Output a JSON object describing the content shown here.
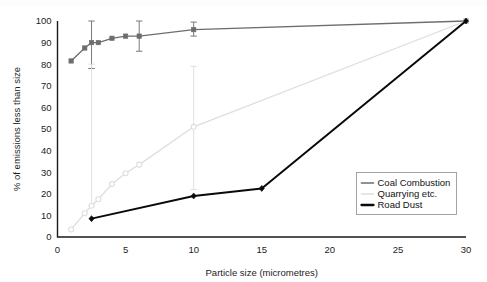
{
  "chart_data": {
    "type": "line",
    "title": "",
    "xlabel": "Particle size (micrometres)",
    "ylabel": "% of emissions less than size",
    "xlim": [
      0,
      30
    ],
    "ylim": [
      0,
      100
    ],
    "xticks": [
      0,
      5,
      10,
      15,
      20,
      25,
      30
    ],
    "yticks": [
      0,
      10,
      20,
      30,
      40,
      50,
      60,
      70,
      80,
      90,
      100
    ],
    "grid": false,
    "legend_position": "lower-right",
    "series": [
      {
        "name": "Coal Combustion",
        "color": "#6d6d6d",
        "marker": "square",
        "linewidth": 1.3,
        "x": [
          1,
          2,
          2.5,
          3,
          4,
          5,
          6,
          10,
          30
        ],
        "values": [
          81.5,
          87.5,
          90.0,
          90.0,
          92.0,
          93.0,
          93.0,
          96.0,
          100.0
        ],
        "error_bars": [
          {
            "x": 2.5,
            "low": 78.0,
            "high": 100.0
          },
          {
            "x": 6,
            "low": 86.0,
            "high": 100.0
          },
          {
            "x": 10,
            "low": 93.0,
            "high": 99.5
          }
        ]
      },
      {
        "name": "Quarrying etc.",
        "color": "#dedede",
        "marker": "circle",
        "linewidth": 1.3,
        "x": [
          1,
          2,
          2.5,
          3,
          4,
          5,
          6,
          10,
          30
        ],
        "values": [
          3.5,
          11.0,
          14.5,
          17.5,
          24.5,
          29.5,
          33.5,
          51.0,
          100.0
        ],
        "error_bars": [
          {
            "x": 2.5,
            "low": 14.5,
            "high": 80.0
          },
          {
            "x": 10,
            "low": 22.0,
            "high": 79.0
          }
        ]
      },
      {
        "name": "Road Dust",
        "color": "#0a0a0a",
        "marker": "diamond",
        "linewidth": 2.0,
        "x": [
          2.5,
          10,
          15,
          30
        ],
        "values": [
          8.5,
          19.0,
          22.5,
          100.0
        ],
        "error_bars": []
      }
    ]
  },
  "legend": {
    "entries": [
      {
        "label": "Coal Combustion"
      },
      {
        "label": "Quarrying etc."
      },
      {
        "label": "Road Dust"
      }
    ]
  },
  "axes": {
    "x_title": "Particle size (micrometres)",
    "y_title": "% of emissions less than size"
  }
}
